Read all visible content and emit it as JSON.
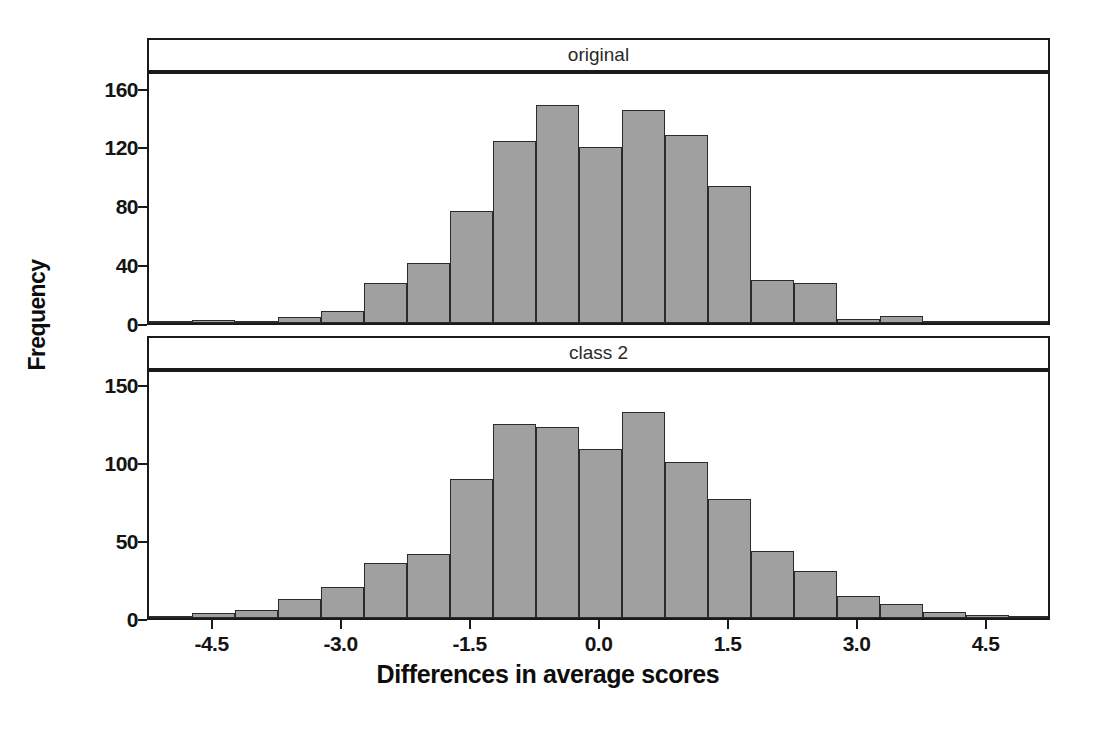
{
  "figure": {
    "ylabel": "Frequency",
    "xlabel": "Differences in average scores"
  },
  "panels": [
    {
      "title": "original"
    },
    {
      "title": "class 2"
    }
  ],
  "axis": {
    "x_ticks": [
      "-4.5",
      "-3.0",
      "-1.5",
      "0.0",
      "1.5",
      "3.0",
      "4.5"
    ],
    "x_tick_values": [
      -4.5,
      -3.0,
      -1.5,
      0.0,
      1.5,
      3.0,
      4.5
    ],
    "top_y_ticks": [
      "0",
      "40",
      "80",
      "120",
      "160"
    ],
    "top_y_tick_values": [
      0,
      40,
      80,
      120,
      160
    ],
    "bottom_y_ticks": [
      "0",
      "50",
      "100",
      "150"
    ],
    "bottom_y_tick_values": [
      0,
      50,
      100,
      150
    ]
  },
  "style": {
    "bar_fill": "#a0a0a0",
    "bar_edge": "#2b2b2b",
    "frame": "#1a1a1a",
    "background": "#ffffff"
  },
  "chart_data": [
    {
      "type": "bar",
      "title": "original",
      "xlabel": "Differences in average scores",
      "ylabel": "Frequency",
      "xlim": [
        -5.25,
        5.25
      ],
      "ylim": [
        0,
        172
      ],
      "grid": false,
      "legend": "none",
      "bin_width": 0.5,
      "bin_centers": [
        -5.0,
        -4.5,
        -4.0,
        -3.5,
        -3.0,
        -2.5,
        -2.0,
        -1.5,
        -1.0,
        -0.5,
        0.0,
        0.5,
        1.0,
        1.5,
        2.0,
        2.5,
        3.0,
        3.5,
        4.0,
        4.5,
        5.0
      ],
      "categories": [
        "-5.0",
        "-4.5",
        "-4.0",
        "-3.5",
        "-3.0",
        "-2.5",
        "-2.0",
        "-1.5",
        "-1.0",
        "-0.5",
        "0.0",
        "0.5",
        "1.0",
        "1.5",
        "2.0",
        "2.5",
        "3.0",
        "3.5",
        "4.0",
        "4.5",
        "5.0"
      ],
      "values": [
        1,
        2,
        1,
        4,
        8,
        27,
        41,
        76,
        124,
        148,
        120,
        145,
        128,
        93,
        29,
        27,
        3,
        5,
        0,
        1,
        1
      ],
      "y_ticks": [
        0,
        40,
        80,
        120,
        160
      ],
      "x_ticks": [
        -4.5,
        -3.0,
        -1.5,
        0.0,
        1.5,
        3.0,
        4.5
      ]
    },
    {
      "type": "bar",
      "title": "class 2",
      "xlabel": "Differences in average scores",
      "ylabel": "Frequency",
      "xlim": [
        -5.25,
        5.25
      ],
      "ylim": [
        0,
        160
      ],
      "grid": false,
      "legend": "none",
      "bin_width": 0.5,
      "bin_centers": [
        -5.0,
        -4.5,
        -4.0,
        -3.5,
        -3.0,
        -2.5,
        -2.0,
        -1.5,
        -1.0,
        -0.5,
        0.0,
        0.5,
        1.0,
        1.5,
        2.0,
        2.5,
        3.0,
        3.5,
        4.0,
        4.5,
        5.0
      ],
      "categories": [
        "-5.0",
        "-4.5",
        "-4.0",
        "-3.5",
        "-3.0",
        "-2.5",
        "-2.0",
        "-1.5",
        "-1.0",
        "-0.5",
        "0.0",
        "0.5",
        "1.0",
        "1.5",
        "2.0",
        "2.5",
        "3.0",
        "3.5",
        "4.0",
        "4.5",
        "5.0"
      ],
      "values": [
        1,
        3,
        5,
        12,
        20,
        35,
        41,
        89,
        124,
        122,
        108,
        132,
        100,
        76,
        43,
        30,
        14,
        9,
        4,
        2,
        1
      ],
      "y_ticks": [
        0,
        50,
        100,
        150
      ],
      "x_ticks": [
        -4.5,
        -3.0,
        -1.5,
        0.0,
        1.5,
        3.0,
        4.5
      ]
    }
  ]
}
